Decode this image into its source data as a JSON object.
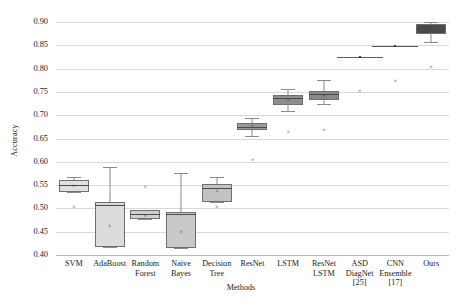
{
  "chart_data": {
    "type": "box",
    "title": "",
    "xlabel": "Methods",
    "ylabel": "Accuracy",
    "ylim": [
      0.4,
      0.9
    ],
    "ytick_labels": [
      "0.90",
      "0.85",
      "0.80",
      "0.75",
      "0.70",
      "0.65",
      "0.60",
      "0.55",
      "0.50",
      "0.45",
      "0.40"
    ],
    "ytick_values": [
      0.9,
      0.85,
      0.8,
      0.75,
      0.7,
      0.65,
      0.6,
      0.55,
      0.5,
      0.45,
      0.4
    ],
    "grid": true,
    "legend": "none",
    "categories": [
      "SVM",
      "AdaBoost",
      "Random Forest",
      "Naive Bayes",
      "Decision Tree",
      "ResNet",
      "LSTM",
      "ResNet LSTM",
      "ASD DiagNet [25]",
      "CNN Ensemble [17]",
      "Ours"
    ],
    "category_label_lines": [
      [
        "SVM"
      ],
      [
        "AdaBoost"
      ],
      [
        "Random",
        "Forest"
      ],
      [
        "Naive",
        "Bayes"
      ],
      [
        "Decision",
        "Tree"
      ],
      [
        "ResNet"
      ],
      [
        "LSTM"
      ],
      [
        "ResNet",
        "LSTM"
      ],
      [
        "ASD",
        "DiagNet",
        "[25]"
      ],
      [
        "CNN",
        "Ensemble",
        "[17]"
      ],
      [
        "Ours"
      ]
    ],
    "boxes": [
      {
        "name": "SVM",
        "whisker_low": 0.535,
        "q1": 0.535,
        "median": 0.551,
        "q3": 0.56,
        "whisker_high": 0.568,
        "mean": 0.548,
        "outliers": [
          0.503
        ],
        "fill": "#e0e0e0"
      },
      {
        "name": "AdaBoost",
        "whisker_low": 0.418,
        "q1": 0.418,
        "median": 0.508,
        "q3": 0.513,
        "whisker_high": 0.588,
        "mean": 0.462,
        "outliers": [],
        "fill": "#dcdcdc"
      },
      {
        "name": "Random Forest",
        "whisker_low": 0.477,
        "q1": 0.477,
        "median": 0.488,
        "q3": 0.497,
        "whisker_high": 0.497,
        "mean": 0.484,
        "outliers": [
          0.545
        ],
        "fill": "#d0d0d0"
      },
      {
        "name": "Naive Bayes",
        "whisker_low": 0.415,
        "q1": 0.415,
        "median": 0.487,
        "q3": 0.492,
        "whisker_high": 0.575,
        "mean": 0.45,
        "outliers": [],
        "fill": "#c9c9c9"
      },
      {
        "name": "Decision Tree",
        "whisker_low": 0.513,
        "q1": 0.513,
        "median": 0.543,
        "q3": 0.552,
        "whisker_high": 0.568,
        "mean": 0.538,
        "outliers": [
          0.503
        ],
        "fill": "#c2c2c2"
      },
      {
        "name": "ResNet",
        "whisker_low": 0.655,
        "q1": 0.669,
        "median": 0.675,
        "q3": 0.684,
        "whisker_high": 0.695,
        "mean": 0.676,
        "outliers": [
          0.604
        ],
        "fill": "#9a9a9a"
      },
      {
        "name": "LSTM",
        "whisker_low": 0.709,
        "q1": 0.722,
        "median": 0.736,
        "q3": 0.744,
        "whisker_high": 0.757,
        "mean": 0.733,
        "outliers": [
          0.663
        ],
        "fill": "#8f8f8f"
      },
      {
        "name": "ResNet LSTM",
        "whisker_low": 0.724,
        "q1": 0.733,
        "median": 0.745,
        "q3": 0.752,
        "whisker_high": 0.775,
        "mean": 0.742,
        "outliers": [
          0.668
        ],
        "fill": "#8a8a8a"
      },
      {
        "name": "ASD DiagNet [25]",
        "flat_value": 0.824,
        "mean": 0.824,
        "outliers": [
          0.751
        ],
        "fill": "none"
      },
      {
        "name": "CNN Ensemble [17]",
        "flat_value": 0.849,
        "mean": 0.849,
        "outliers": [
          0.773
        ],
        "fill": "none"
      },
      {
        "name": "Ours",
        "whisker_low": 0.857,
        "q1": 0.874,
        "median": 0.888,
        "q3": 0.895,
        "whisker_high": 0.9,
        "mean": 0.884,
        "outliers": [
          0.803
        ],
        "fill": "#4a4a4a"
      }
    ],
    "marker_symbol": "×"
  }
}
